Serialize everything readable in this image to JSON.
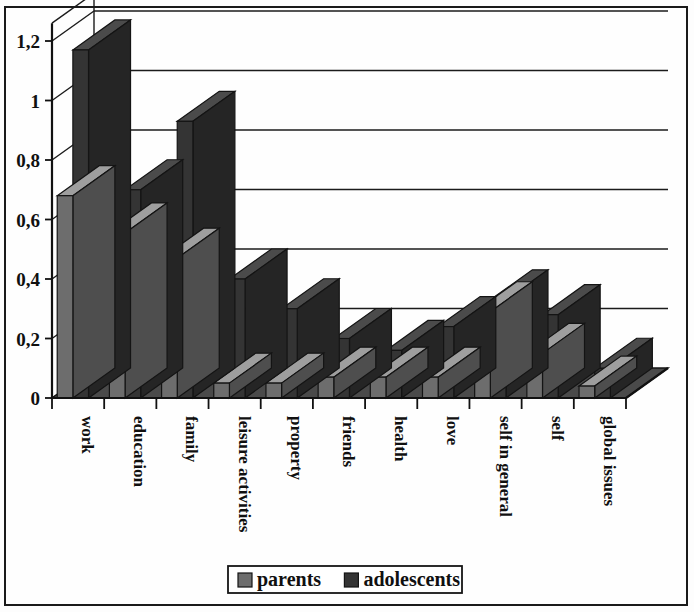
{
  "chart_data": {
    "type": "bar",
    "title": "",
    "subtitle": "",
    "xlabel": "",
    "ylabel": "",
    "ylim": [
      0,
      1.26
    ],
    "grid": true,
    "legend_position": "bottom",
    "style": "3d-clustered-column",
    "decimal_separator": ",",
    "categories": [
      "work",
      "education",
      "family",
      "leisure activities",
      "property",
      "friends",
      "health",
      "love",
      "self in general",
      "self",
      "global issues"
    ],
    "ytick_labels": [
      "0",
      "0,2",
      "0,4",
      "0,6",
      "0,8",
      "1",
      "1,2"
    ],
    "ytick_values": [
      0,
      0.2,
      0.4,
      0.6,
      0.8,
      1,
      1.2
    ],
    "series": [
      {
        "name": "parents",
        "color": "#6d6d6d",
        "values": [
          0.68,
          0.555,
          0.47,
          0.05,
          0.05,
          0.07,
          0.07,
          0.07,
          0.29,
          0.15,
          0.04
        ]
      },
      {
        "name": "adolescents",
        "color": "#343434",
        "values": [
          1.17,
          0.7,
          0.93,
          0.4,
          0.3,
          0.2,
          0.16,
          0.24,
          0.33,
          0.28,
          0.1
        ]
      }
    ]
  },
  "legend": {
    "items": [
      {
        "label": "parents",
        "swatch": "#6d6d6d"
      },
      {
        "label": "adolescents",
        "swatch": "#343434"
      }
    ]
  },
  "colors": {
    "parents": "#6d6d6d",
    "adolescents": "#343434",
    "grid": "#1b1b1b",
    "axis": "#111111",
    "background": "#fefefe",
    "frame": "#1a1a1a"
  }
}
